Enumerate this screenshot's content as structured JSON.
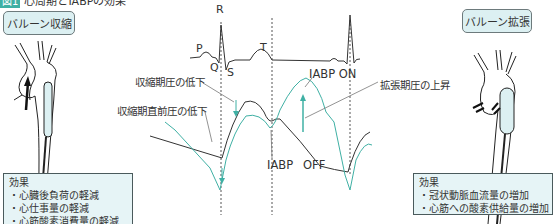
{
  "title": {
    "number": "図1",
    "text": "心周期とIABPの効果"
  },
  "left": {
    "state_label": "バルーン収縮",
    "effects_heading": "効果",
    "effects": [
      "・心臓後負荷の軽減",
      "・心仕事量の軽減",
      "・心筋酸素消費量の軽減"
    ]
  },
  "right": {
    "state_label": "バルーン拡張",
    "effects_heading": "効果",
    "effects": [
      "・冠状動脈血流量の増加",
      "・心筋への酸素供給量の増加"
    ]
  },
  "ecg": {
    "P": "P",
    "Q": "Q",
    "R": "R",
    "S": "S",
    "T": "T"
  },
  "annotations": {
    "systolic_drop": "収縮期圧の低下",
    "presystolic_drop": "収縮期直前圧の低下",
    "iabp_on": "IABP ON",
    "iabp_off_1": "IABP",
    "iabp_off_2": "OFF",
    "diastolic_rise": "拡張期圧の上昇"
  },
  "colors": {
    "accent": "#3fb0a4",
    "box_fill": "#dcf0f2",
    "effect_fill": "#e6f4f6",
    "line": "#333333"
  }
}
